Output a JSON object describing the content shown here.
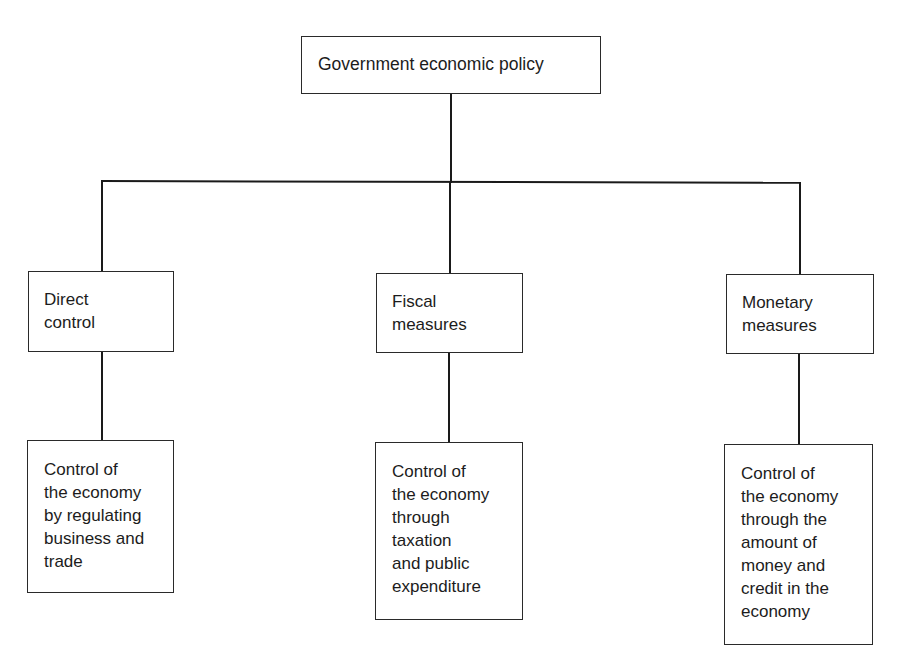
{
  "diagram": {
    "type": "hierarchy",
    "root": {
      "label": "Government economic policy"
    },
    "branches": [
      {
        "label": "Direct\ncontrol",
        "description": "Control of\nthe economy\nby regulating\nbusiness and\ntrade"
      },
      {
        "label": "Fiscal\nmeasures",
        "description": "Control of\nthe economy\nthrough\ntaxation\nand public\nexpenditure"
      },
      {
        "label": "Monetary\nmeasures",
        "description": "Control of\nthe economy\nthrough the\namount of\nmoney and\ncredit in the\neconomy"
      }
    ],
    "colors": {
      "line": "#1a1a1a",
      "box_border": "#2a2a2a",
      "background": "#ffffff",
      "text": "#1c1c1c"
    }
  }
}
